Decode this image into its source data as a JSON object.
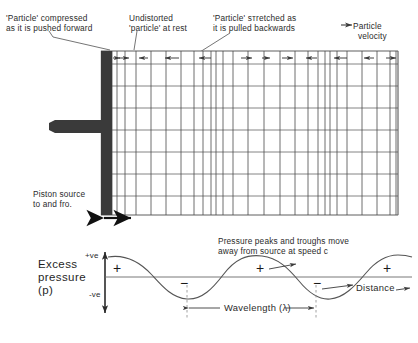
{
  "figure": {
    "title_semantic": "longitudinal-sound-wave-from-piston-source",
    "annotations": {
      "compressed": "'Particle' compressed\nas it is pushed forward",
      "undistorted": "Undistorted\n'particle' at rest",
      "stretched": "'Particle' sтretched as\nit is pulled backwards",
      "velocity_legend": "Particle\n  velocity",
      "piston": "Piston source\nto and fro.",
      "peaks": "Pressure peaks and troughs move\naway from source at speed c"
    }
  },
  "medium_panel": {
    "name": "particle-grid",
    "rect": {
      "x": 101,
      "y": 51,
      "w": 297,
      "h": 164
    },
    "piston": {
      "bar": {
        "x": 101,
        "y": 51,
        "w": 11,
        "h": 164
      },
      "rod": {
        "x": 55,
        "y": 120,
        "w": 46,
        "h": 13
      },
      "motion_arrow": {
        "x1": 103,
        "y1": 218,
        "x2": 130,
        "y2": 218
      }
    },
    "row_lines_y": [
      51,
      64,
      86,
      108,
      130,
      152,
      174,
      196,
      215
    ],
    "column_edges_x": [
      112,
      117,
      125,
      136,
      151,
      166,
      181,
      194,
      203,
      211,
      216,
      223,
      233,
      248,
      264,
      280,
      295,
      308,
      318,
      325,
      330,
      337,
      347,
      362,
      377,
      390,
      396,
      398
    ],
    "velocity_arrows": [
      {
        "x": 114,
        "dir": "right",
        "len": 5
      },
      {
        "x": 121,
        "dir": "right",
        "len": 7
      },
      {
        "x": 143,
        "dir": "left",
        "len": 9
      },
      {
        "x": 173,
        "dir": "left",
        "len": 12
      },
      {
        "x": 206,
        "dir": "left",
        "len": 9
      },
      {
        "x": 247,
        "dir": "right",
        "len": 7
      },
      {
        "x": 266,
        "dir": "right",
        "len": 5
      },
      {
        "x": 287,
        "dir": "right",
        "len": 7
      },
      {
        "x": 312,
        "dir": "left",
        "len": 7
      },
      {
        "x": 341,
        "dir": "left",
        "len": 10
      },
      {
        "x": 369,
        "dir": "left",
        "len": 8
      },
      {
        "x": 392,
        "dir": "right",
        "len": 7
      }
    ],
    "leader_lines": [
      {
        "x1": 48,
        "y1": 30,
        "x2": 112,
        "y2": 49
      },
      {
        "x1": 136,
        "y1": 30,
        "x2": 133,
        "y2": 50
      },
      {
        "x1": 228,
        "y1": 32,
        "x2": 190,
        "y2": 58
      }
    ]
  },
  "chart_data": {
    "type": "line",
    "xlabel": "Distance",
    "ylabel": "Excess pressure (p)",
    "y_tick_labels": [
      "+ve",
      "-ve"
    ],
    "axis": {
      "origin": {
        "x": 105,
        "y": 277
      },
      "y_top": 252,
      "y_bottom": 313,
      "x_right": 412,
      "baseline_y": 277
    },
    "waveform": {
      "amplitude_px": 22,
      "wavelength_px": 124,
      "phase": "cosine-positive-at-origin",
      "x_start": 110,
      "x_end": 412,
      "description": "Cosine wave: compression peaks (+) at x=118, 262, 392; rarefaction troughs (-) at x=185, 312"
    },
    "markers": [
      {
        "label": "+",
        "x": 117,
        "y": 268,
        "kind": "compression"
      },
      {
        "label": "−",
        "x": 184,
        "y": 283,
        "kind": "rarefaction"
      },
      {
        "label": "+",
        "x": 260,
        "y": 268,
        "kind": "compression"
      },
      {
        "label": "−",
        "x": 317,
        "y": 283,
        "kind": "rarefaction"
      },
      {
        "label": "+",
        "x": 387,
        "y": 268,
        "kind": "compression"
      }
    ],
    "travel_arrows": [
      {
        "x1": 267,
        "y1": 270,
        "x2": 290,
        "y2": 266
      },
      {
        "x1": 322,
        "y1": 288,
        "x2": 352,
        "y2": 284
      },
      {
        "x1": 390,
        "y1": 292,
        "x2": 404,
        "y2": 289
      }
    ],
    "wavelength_marker": {
      "label": "Wavelength (λ)",
      "x1": 187,
      "x2": 316,
      "y": 308,
      "dashed_guides_x": [
        187,
        316
      ],
      "dash_top_y": 283,
      "dash_bottom_y": 318
    },
    "grid": false,
    "legend": "none"
  },
  "colors": {
    "ink": "#1a1a1a",
    "grid": "#4a4a4a",
    "grid_light": "#8a8a8a",
    "piston": "#3a3a3a",
    "curve": "#555555",
    "background": "#ffffff"
  }
}
